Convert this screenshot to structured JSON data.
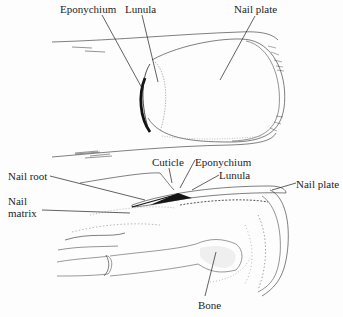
{
  "figure": {
    "top_view": {
      "labels": {
        "eponychium": "Eponychium",
        "lunula": "Lunula",
        "nail_plate": "Nail plate"
      }
    },
    "side_view": {
      "labels": {
        "nail_root": "Nail root",
        "nail_matrix_line1": "Nail",
        "nail_matrix_line2": "matrix",
        "cuticle": "Cuticle",
        "eponychium": "Eponychium",
        "lunula": "Lunula",
        "nail_plate": "Nail plate",
        "bone": "Bone"
      }
    }
  },
  "colors": {
    "ink": "#1e1e1e",
    "background": "#fdfdfd",
    "stipple": "#9a9a9a"
  }
}
